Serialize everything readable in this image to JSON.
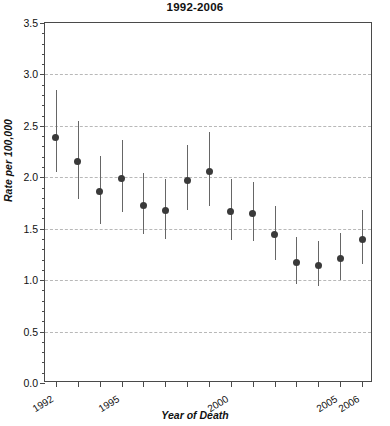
{
  "chart_data": {
    "type": "scatter",
    "title": "1992-2006",
    "xlabel": "Year of Death",
    "ylabel": "Rate per 100,000",
    "xlim": [
      1991.5,
      2006.5
    ],
    "ylim": [
      0.0,
      3.5
    ],
    "grid": true,
    "legend": null,
    "ytick_labels": [
      "0.0",
      "0.5",
      "1.0",
      "1.5",
      "2.0",
      "2.5",
      "3.0",
      "3.5"
    ],
    "ytick_values": [
      0.0,
      0.5,
      1.0,
      1.5,
      2.0,
      2.5,
      3.0,
      3.5
    ],
    "xtick_values": [
      1992,
      1993,
      1994,
      1995,
      1996,
      1997,
      1998,
      1999,
      2000,
      2001,
      2002,
      2003,
      2004,
      2005,
      2006
    ],
    "xtick_labels_shown": [
      "1992",
      "1995",
      "2000",
      "2005",
      "2006"
    ],
    "categories": [
      1992,
      1993,
      1994,
      1995,
      1996,
      1997,
      1998,
      1999,
      2000,
      2001,
      2002,
      2003,
      2004,
      2005,
      2006
    ],
    "values": [
      2.39,
      2.15,
      1.86,
      1.99,
      1.73,
      1.68,
      1.97,
      2.06,
      1.67,
      1.65,
      1.44,
      1.17,
      1.14,
      1.21,
      1.4
    ],
    "error_low": [
      2.05,
      1.79,
      1.55,
      1.66,
      1.45,
      1.4,
      1.68,
      1.72,
      1.39,
      1.38,
      1.2,
      0.96,
      0.94,
      1.0,
      1.16
    ],
    "error_high": [
      2.85,
      2.55,
      2.21,
      2.36,
      2.04,
      1.98,
      2.31,
      2.44,
      1.98,
      1.95,
      1.72,
      1.42,
      1.38,
      1.46,
      1.68
    ],
    "marker_color": "#3a3a3a",
    "errorbar_color": "#666666",
    "grid_color": "#b8b8b8",
    "axis_color": "#4a4a4a"
  }
}
